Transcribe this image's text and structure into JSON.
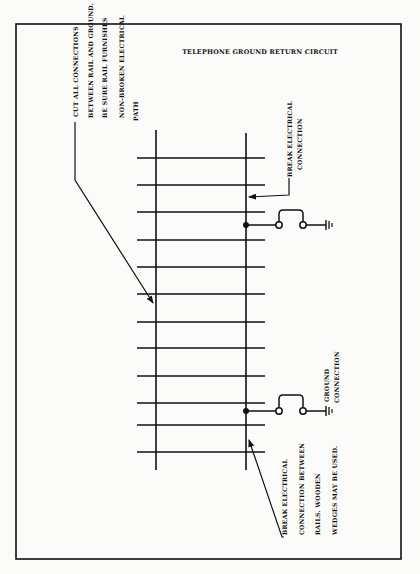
{
  "title": "TELEPHONE GROUND RETURN CIRCUIT",
  "notes": {
    "cut_connections": [
      "CUT ALL CONNECTIONS",
      "BETWEEN RAIL AND GROUND.",
      "BE SURE RAIL FURNISHES",
      "NON-BROKEN ELECTRICAL",
      "PATH"
    ],
    "break_connection_top": [
      "BREAK ELECTRICAL",
      "CONNECTION"
    ],
    "ground_connection": [
      "GROUND",
      "CONNECTION"
    ],
    "break_connection_bottom": [
      "BREAK ELECTRICAL",
      "CONNECTION BETWEEN",
      "RAILS.  WOODEN",
      "WEDGES MAY BE USED."
    ]
  },
  "diagram": {
    "frame": {
      "x": 16,
      "y": 24,
      "w": 385,
      "h": 535
    },
    "rails": {
      "left_x": 156,
      "right_x": 246,
      "top_left": 130,
      "top_right": 133,
      "bottom": 470
    },
    "ties": {
      "x1": 137,
      "x2": 265,
      "y": [
        158,
        185,
        212,
        240,
        267,
        294,
        322,
        348,
        376,
        403,
        425,
        452
      ]
    },
    "ground_circuits": [
      {
        "y": 225,
        "bridge_top": 210
      },
      {
        "y": 411,
        "bridge_top": 395
      }
    ],
    "colors": {
      "ink": "#111111",
      "paper": "#fbfbf9"
    }
  }
}
